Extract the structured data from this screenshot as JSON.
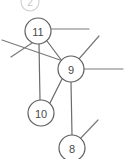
{
  "diagram": {
    "type": "node-link-graph",
    "canvas": {
      "width": 124,
      "height": 159,
      "background": "#ffffff"
    },
    "style": {
      "edge_color": "#6b6b6b",
      "node_stroke": "#5f5f5f",
      "node_fill": "#ffffff",
      "label_color": "#4a4a4a",
      "clipped_color": "#c4c4c4"
    },
    "nodes": [
      {
        "id": "n2",
        "label": "2",
        "cx": 30,
        "cy": 2,
        "r": 9,
        "clipped": true
      },
      {
        "id": "n11",
        "label": "11",
        "cx": 38,
        "cy": 31,
        "r": 13,
        "clipped": false
      },
      {
        "id": "n9",
        "label": "9",
        "cx": 71,
        "cy": 69,
        "r": 13,
        "clipped": false
      },
      {
        "id": "n10",
        "label": "10",
        "cx": 41,
        "cy": 113,
        "r": 13,
        "clipped": false
      },
      {
        "id": "n8",
        "label": "8",
        "cx": 72,
        "cy": 148,
        "r": 13,
        "clipped": false
      }
    ],
    "edges": [
      {
        "id": "e-11-9",
        "from": "n11",
        "to": "n9",
        "x1": 47,
        "y1": 41,
        "x2": 62,
        "y2": 61
      },
      {
        "id": "e-11-10",
        "from": "n11",
        "to": "n10",
        "x1": 39,
        "y1": 44,
        "x2": 40,
        "y2": 100
      },
      {
        "id": "e-9-10",
        "from": "n9",
        "to": "n10",
        "x1": 62,
        "y1": 79,
        "x2": 50,
        "y2": 103
      },
      {
        "id": "e-9-8",
        "from": "n9",
        "to": "n8",
        "x1": 71,
        "y1": 82,
        "x2": 72,
        "y2": 135
      }
    ],
    "stub_edges": [
      {
        "id": "s-11-right",
        "from": "n11",
        "x1": 51,
        "y1": 29,
        "x2": 89,
        "y2": 29
      },
      {
        "id": "s-11-downleft",
        "from": "n11",
        "x1": 32,
        "y1": 43,
        "x2": 11,
        "y2": 57
      },
      {
        "id": "s-cross-left",
        "from": "n9",
        "x1": 2,
        "y1": 40,
        "x2": 60,
        "y2": 60
      },
      {
        "id": "s-9-upright",
        "from": "n9",
        "x1": 78,
        "y1": 60,
        "x2": 99,
        "y2": 36
      },
      {
        "id": "s-9-right",
        "from": "n9",
        "x1": 84,
        "y1": 69,
        "x2": 123,
        "y2": 69
      },
      {
        "id": "s-8-upright",
        "from": "n8",
        "x1": 79,
        "y1": 140,
        "x2": 98,
        "y2": 120
      }
    ],
    "node_count_label": "5",
    "edge_count_label": "4"
  }
}
